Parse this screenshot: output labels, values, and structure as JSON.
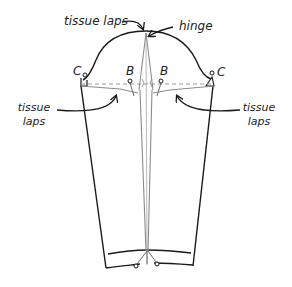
{
  "diagram": {
    "colors": {
      "outline": "#1a1a1a",
      "guide": "#8c8c8c",
      "dashed": "#9a9a9a",
      "background": "#ffffff"
    },
    "labels": {
      "tissue_laps_top": "tissue laps",
      "hinge": "hinge",
      "c_left": "C",
      "c_right": "C",
      "b_left": "B",
      "b_right": "B",
      "tissue_left_line1": "tissue",
      "tissue_left_line2": "laps",
      "tissue_right_line1": "tissue",
      "tissue_right_line2": "laps"
    },
    "points": {
      "cap_top": [
        146,
        31
      ],
      "c_left": [
        85,
        75
      ],
      "c_right": [
        212,
        73
      ],
      "b_left": [
        129,
        81
      ],
      "b_right": [
        161,
        81
      ],
      "hem_pin_left": [
        135,
        266
      ],
      "hem_pin_right": [
        157,
        264
      ]
    }
  }
}
